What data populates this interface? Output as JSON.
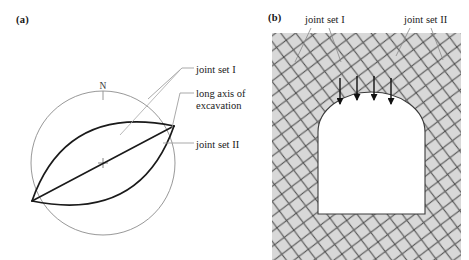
{
  "figure": {
    "panels": [
      {
        "id": "a",
        "label": "(a)",
        "type": "stereonet",
        "compass_label": "N",
        "callouts": [
          {
            "name": "joint-set-I",
            "text": "joint set I"
          },
          {
            "name": "long-axis",
            "text": "long axis of\nexcavation"
          },
          {
            "name": "joint-set-II",
            "text": "joint set II"
          }
        ]
      },
      {
        "id": "b",
        "label": "(b)",
        "type": "tunnel-cross-section",
        "callouts": [
          {
            "name": "joint-set-I",
            "text": "joint set I"
          },
          {
            "name": "joint-set-II",
            "text": "joint set II"
          }
        ],
        "arrow_count": 4
      }
    ],
    "colors": {
      "stroke_dark": "#1a1a1a",
      "stroke_light": "#8c8c8c",
      "rock_fill": "#d8d8d8",
      "joint_line": "#4a4a4a",
      "excavation_fill": "#ffffff",
      "background": "#ffffff"
    },
    "geometry": {
      "stereonet": {
        "cx": 103,
        "cy": 163,
        "r": 72,
        "intersection_lower_left": [
          32,
          201
        ],
        "intersection_upper_right": [
          174,
          126
        ]
      },
      "rock_block": {
        "x": 272,
        "y": 33,
        "width": 189,
        "height": 227
      },
      "tunnel": {
        "x": 318,
        "y": 96,
        "width": 107,
        "height": 118,
        "arch_spring_y": 132
      }
    }
  }
}
